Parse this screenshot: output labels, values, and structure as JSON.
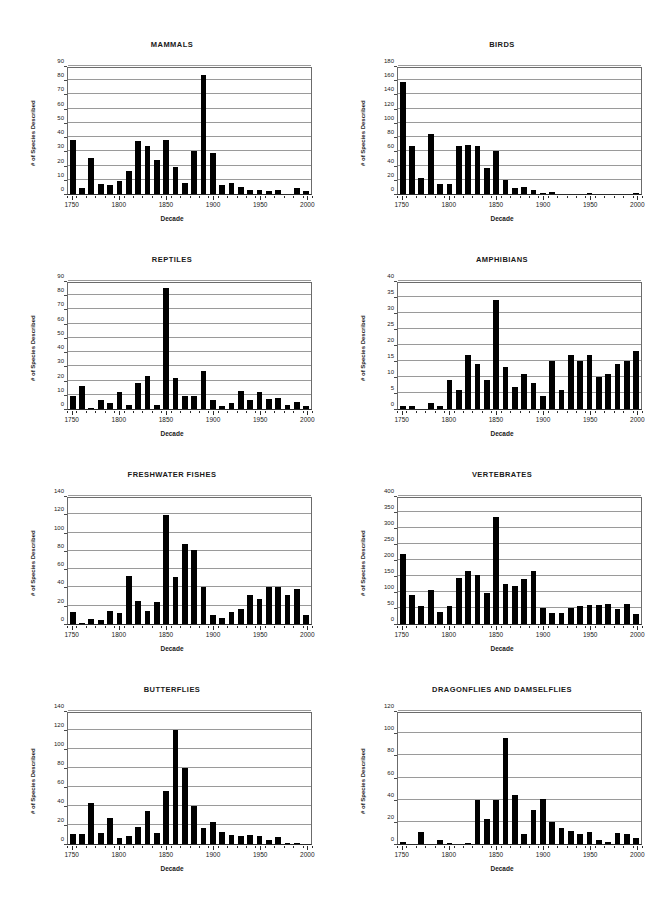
{
  "page": {
    "background": "#ffffff",
    "bar_color": "#000000",
    "grid_color": "#9a9a9a",
    "axis_color": "#2b2b2b"
  },
  "common": {
    "xlabel": "Decade",
    "ylabel": "# of Species Described",
    "xlim": [
      1745,
      2005
    ],
    "xticks": [
      1750,
      1800,
      1850,
      1900,
      1950,
      2000
    ],
    "decades": [
      1750,
      1760,
      1770,
      1780,
      1790,
      1800,
      1810,
      1820,
      1830,
      1840,
      1850,
      1860,
      1870,
      1880,
      1890,
      1900,
      1910,
      1920,
      1930,
      1940,
      1950,
      1960,
      1970,
      1980,
      1990,
      2000
    ]
  },
  "chart_data": [
    {
      "type": "bar",
      "id": "mammals",
      "title": "MAMMALS",
      "xlabel": "Decade",
      "ylabel": "# of Species Described",
      "ylim": [
        0,
        90
      ],
      "yticks": [
        0,
        10,
        20,
        30,
        40,
        50,
        60,
        70,
        80,
        90
      ],
      "grid": true,
      "legend": "none",
      "categories": [
        1750,
        1760,
        1770,
        1780,
        1790,
        1800,
        1810,
        1820,
        1830,
        1840,
        1850,
        1860,
        1870,
        1880,
        1890,
        1900,
        1910,
        1920,
        1930,
        1940,
        1950,
        1960,
        1970,
        1980,
        1990,
        2000
      ],
      "values": [
        38,
        4,
        25,
        7,
        6,
        9,
        16,
        37,
        34,
        24,
        38,
        19,
        8,
        30,
        84,
        29,
        6,
        8,
        5,
        3,
        3,
        2,
        3,
        0,
        4,
        2
      ]
    },
    {
      "type": "bar",
      "id": "birds",
      "title": "BIRDS",
      "xlabel": "Decade",
      "ylabel": "# of Species Described",
      "ylim": [
        0,
        180
      ],
      "yticks": [
        0,
        20,
        40,
        60,
        80,
        100,
        120,
        140,
        160,
        180
      ],
      "grid": true,
      "legend": "none",
      "categories": [
        1750,
        1760,
        1770,
        1780,
        1790,
        1800,
        1810,
        1820,
        1830,
        1840,
        1850,
        1860,
        1870,
        1880,
        1890,
        1900,
        1910,
        1920,
        1930,
        1940,
        1950,
        1960,
        1970,
        1980,
        1990,
        2000
      ],
      "values": [
        157,
        68,
        23,
        84,
        14,
        14,
        67,
        69,
        67,
        37,
        60,
        20,
        8,
        10,
        6,
        2,
        3,
        0,
        0,
        0,
        1,
        0,
        0,
        0,
        0,
        1
      ]
    },
    {
      "type": "bar",
      "id": "reptiles",
      "title": "REPTILES",
      "xlabel": "Decade",
      "ylabel": "# of Species Described",
      "ylim": [
        0,
        90
      ],
      "yticks": [
        0,
        10,
        20,
        30,
        40,
        50,
        60,
        70,
        80,
        90
      ],
      "grid": true,
      "legend": "none",
      "categories": [
        1750,
        1760,
        1770,
        1780,
        1790,
        1800,
        1810,
        1820,
        1830,
        1840,
        1850,
        1860,
        1870,
        1880,
        1890,
        1900,
        1910,
        1920,
        1930,
        1940,
        1950,
        1960,
        1970,
        1980,
        1990,
        2000
      ],
      "values": [
        9,
        16,
        1,
        6,
        4,
        12,
        3,
        18,
        23,
        3,
        85,
        22,
        9,
        9,
        27,
        6,
        2,
        4,
        13,
        6,
        12,
        7,
        8,
        3,
        5,
        2
      ]
    },
    {
      "type": "bar",
      "id": "amphibians",
      "title": "AMPHIBIANS",
      "xlabel": "Decade",
      "ylabel": "# of Species Described",
      "ylim": [
        0,
        40
      ],
      "yticks": [
        0,
        5,
        10,
        15,
        20,
        25,
        30,
        35,
        40
      ],
      "grid": true,
      "legend": "none",
      "categories": [
        1750,
        1760,
        1770,
        1780,
        1790,
        1800,
        1810,
        1820,
        1830,
        1840,
        1850,
        1860,
        1870,
        1880,
        1890,
        1900,
        1910,
        1920,
        1930,
        1940,
        1950,
        1960,
        1970,
        1980,
        1990,
        2000
      ],
      "values": [
        1,
        1,
        0,
        2,
        1,
        9,
        6,
        17,
        14,
        9,
        34,
        13,
        7,
        11,
        8,
        4,
        15,
        6,
        17,
        15,
        17,
        10,
        11,
        14,
        15,
        18
      ]
    },
    {
      "type": "bar",
      "id": "freshwater-fishes",
      "title": "FRESHWATER FISHES",
      "xlabel": "Decade",
      "ylabel": "# of Species Described",
      "ylim": [
        0,
        140
      ],
      "yticks": [
        0,
        20,
        40,
        60,
        80,
        100,
        120,
        140
      ],
      "grid": true,
      "legend": "none",
      "categories": [
        1750,
        1760,
        1770,
        1780,
        1790,
        1800,
        1810,
        1820,
        1830,
        1840,
        1850,
        1860,
        1870,
        1880,
        1890,
        1900,
        1910,
        1920,
        1930,
        1940,
        1950,
        1960,
        1970,
        1980,
        1990,
        2000
      ],
      "values": [
        13,
        1,
        6,
        4,
        14,
        12,
        52,
        25,
        14,
        24,
        119,
        51,
        87,
        81,
        40,
        10,
        7,
        13,
        16,
        32,
        27,
        41,
        40,
        32,
        38,
        10
      ]
    },
    {
      "type": "bar",
      "id": "vertebrates",
      "title": "VERTEBRATES",
      "xlabel": "Decade",
      "ylabel": "# of Species Described",
      "ylim": [
        0,
        400
      ],
      "yticks": [
        0,
        50,
        100,
        150,
        200,
        250,
        300,
        350,
        400
      ],
      "grid": true,
      "legend": "none",
      "categories": [
        1750,
        1760,
        1770,
        1780,
        1790,
        1800,
        1810,
        1820,
        1830,
        1840,
        1850,
        1860,
        1870,
        1880,
        1890,
        1900,
        1910,
        1920,
        1930,
        1940,
        1950,
        1960,
        1970,
        1980,
        1990,
        2000
      ],
      "values": [
        218,
        91,
        55,
        105,
        39,
        56,
        145,
        166,
        153,
        98,
        335,
        125,
        119,
        142,
        165,
        51,
        34,
        33,
        51,
        57,
        59,
        60,
        62,
        48,
        62,
        31
      ]
    },
    {
      "type": "bar",
      "id": "butterflies",
      "title": "BUTTERFLIES",
      "xlabel": "Decade",
      "ylabel": "# of Species Described",
      "ylim": [
        0,
        140
      ],
      "yticks": [
        0,
        20,
        40,
        60,
        80,
        100,
        120,
        140
      ],
      "grid": true,
      "legend": "none",
      "categories": [
        1750,
        1760,
        1770,
        1780,
        1790,
        1800,
        1810,
        1820,
        1830,
        1840,
        1850,
        1860,
        1870,
        1880,
        1890,
        1900,
        1910,
        1920,
        1930,
        1940,
        1950,
        1960,
        1970,
        1980,
        1990,
        2000
      ],
      "values": [
        11,
        11,
        43,
        12,
        27,
        6,
        8,
        18,
        35,
        12,
        56,
        120,
        80,
        40,
        17,
        23,
        13,
        10,
        8,
        10,
        8,
        4,
        7,
        1,
        1,
        0
      ]
    },
    {
      "type": "bar",
      "id": "dragonflies-and-damselflies",
      "title": "DRAGONFLIES AND DAMSELFLIES",
      "xlabel": "Decade",
      "ylabel": "# of Species Described",
      "ylim": [
        0,
        120
      ],
      "yticks": [
        0,
        20,
        40,
        60,
        80,
        100,
        120
      ],
      "grid": true,
      "legend": "none",
      "categories": [
        1750,
        1760,
        1770,
        1780,
        1790,
        1800,
        1810,
        1820,
        1830,
        1840,
        1850,
        1860,
        1870,
        1880,
        1890,
        1900,
        1910,
        1920,
        1930,
        1940,
        1950,
        1960,
        1970,
        1980,
        1990,
        2000
      ],
      "values": [
        2,
        0,
        11,
        0,
        4,
        1,
        0,
        1,
        40,
        23,
        40,
        96,
        44,
        9,
        31,
        41,
        20,
        14,
        12,
        9,
        11,
        4,
        2,
        10,
        9,
        5
      ]
    }
  ],
  "layout": {
    "columns": 2,
    "rows": 4,
    "panels": [
      {
        "chart": 0,
        "left": 22,
        "top": 40,
        "width": 300,
        "height": 200
      },
      {
        "chart": 1,
        "left": 352,
        "top": 40,
        "width": 300,
        "height": 200
      },
      {
        "chart": 2,
        "left": 22,
        "top": 255,
        "width": 300,
        "height": 200
      },
      {
        "chart": 3,
        "left": 352,
        "top": 255,
        "width": 300,
        "height": 200
      },
      {
        "chart": 4,
        "left": 22,
        "top": 470,
        "width": 300,
        "height": 200
      },
      {
        "chart": 5,
        "left": 352,
        "top": 470,
        "width": 300,
        "height": 200
      },
      {
        "chart": 6,
        "left": 22,
        "top": 685,
        "width": 300,
        "height": 205
      },
      {
        "chart": 7,
        "left": 352,
        "top": 685,
        "width": 300,
        "height": 205
      }
    ],
    "plot_inset": {
      "left": 45,
      "top": 27,
      "right": 10,
      "bottom": 45
    }
  }
}
